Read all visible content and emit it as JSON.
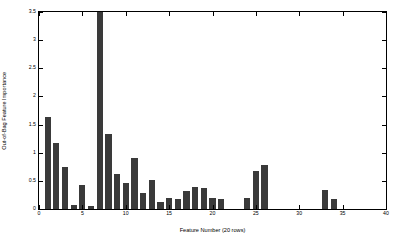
{
  "chart_data": {
    "type": "bar",
    "title": "",
    "xlabel": "Feature Number (20 rows)",
    "ylabel": "Out-of-Bag Feature Importance",
    "xlim": [
      0,
      40
    ],
    "ylim": [
      0,
      3.5
    ],
    "xticks": [
      0,
      5,
      10,
      15,
      20,
      25,
      30,
      35,
      40
    ],
    "xtick_labels": [
      "0",
      "5",
      "10",
      "15",
      "20",
      "25",
      "30",
      "35",
      "40"
    ],
    "yticks": [
      0,
      0.5,
      1,
      1.5,
      2,
      2.5,
      3,
      3.5
    ],
    "ytick_labels": [
      "0",
      "0.5",
      "1",
      "1.5",
      "2",
      "2.5",
      "3",
      "3.5"
    ],
    "grid": false,
    "legend": null,
    "bar_color": "#3a3a3a",
    "bar_width": 0.72,
    "categories": [
      1,
      2,
      3,
      4,
      5,
      6,
      7,
      8,
      9,
      10,
      11,
      12,
      13,
      14,
      15,
      16,
      17,
      18,
      19,
      20,
      21,
      22,
      23,
      24,
      25,
      26,
      27,
      28,
      29,
      30,
      31,
      32,
      33,
      34,
      35,
      36,
      37
    ],
    "values": [
      1.63,
      1.18,
      0.75,
      0.08,
      0.42,
      0.05,
      3.5,
      1.33,
      0.62,
      0.47,
      0.9,
      0.28,
      0.51,
      0.12,
      0.2,
      0.18,
      0.32,
      0.4,
      0.37,
      0.2,
      0.17,
      0,
      0,
      0.2,
      0.68,
      0.78,
      0,
      0,
      0,
      0,
      0,
      0,
      0.33,
      0.18,
      0,
      0,
      0
    ],
    "note_clipped_bar": {
      "index": 7,
      "displayed_value": 3.5,
      "clipped": true
    }
  }
}
